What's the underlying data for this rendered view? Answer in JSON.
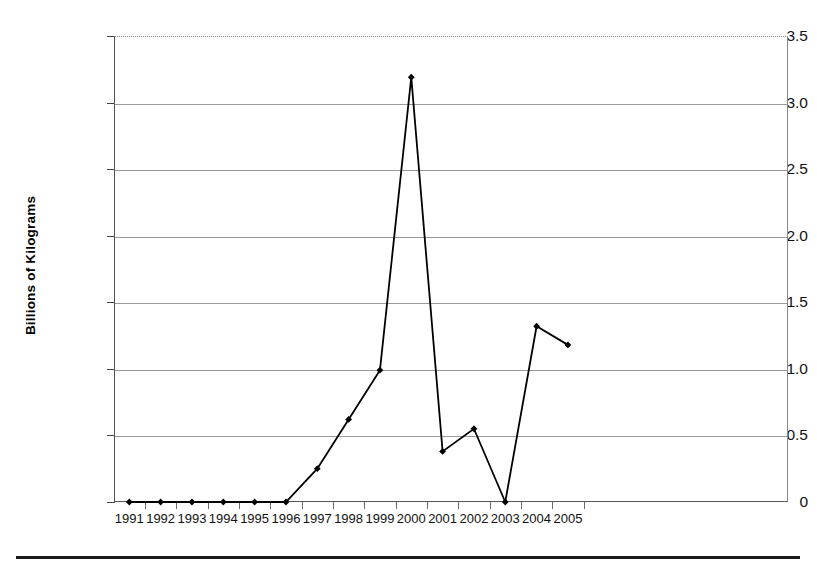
{
  "chart_data": {
    "type": "line",
    "title": "",
    "xlabel": "",
    "ylabel": "Billions of Kilograms",
    "categories": [
      "1991",
      "1992",
      "1993",
      "1994",
      "1995",
      "1996",
      "1997",
      "1998",
      "1999",
      "2000",
      "2001",
      "2002",
      "2003",
      "2004",
      "2005"
    ],
    "values": [
      0,
      0,
      0,
      0,
      0,
      0,
      0.25,
      0.62,
      0.99,
      3.19,
      0.38,
      0.55,
      0.0,
      1.32,
      1.18
    ],
    "series": [
      {
        "name": "",
        "values": [
          0,
          0,
          0,
          0,
          0,
          0,
          0.25,
          0.62,
          0.99,
          3.19,
          0.38,
          0.55,
          0.0,
          1.32,
          1.18
        ]
      }
    ],
    "ylim": [
      0,
      3.5
    ],
    "ytick_labels": [
      "3.5",
      "3.0",
      "2.5",
      "2.0",
      "1.5",
      "1.0",
      "0.5",
      "0"
    ],
    "ytick_values": [
      3.5,
      3.0,
      2.5,
      2.0,
      1.5,
      1.0,
      0.5,
      0
    ],
    "grid": true,
    "grid_axis": "y",
    "legend": "none",
    "marker": "diamond",
    "line_color": "#000000",
    "marker_color": "#000000",
    "grid_color": "#9a9a9a",
    "axis_color": "#555555",
    "background": "#ffffff"
  },
  "figure": {
    "ylabel": "Billions of Kilograms",
    "bottom_rule_color": "#1a1a1a"
  }
}
